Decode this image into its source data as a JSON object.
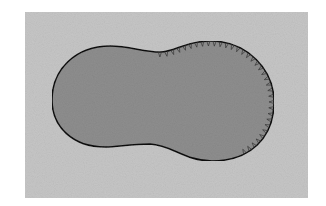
{
  "figure": {
    "background": {
      "x": 25,
      "y": 12,
      "width": 283,
      "height": 186,
      "color": "#c6c6c6"
    },
    "region": {
      "fill": "#8e8e8e",
      "stroke": "#111111",
      "stroke_width": 1.6,
      "path": "M 52 100 C 52 70 75 46 110 46 C 130 46 143 52 160 52 C 175 52 185 41 210 41 C 248 41 274 70 274 102 C 274 138 250 161 212 161 C 185 161 172 145 150 144 C 130 144 118 147 105 147 C 73 147 52 127 52 100 Z"
    },
    "serrations": {
      "color": "#333333",
      "start": {
        "x": 160,
        "y": 52
      },
      "end": {
        "x": 243,
        "y": 150
      },
      "count": 34,
      "direction": "inward"
    }
  }
}
